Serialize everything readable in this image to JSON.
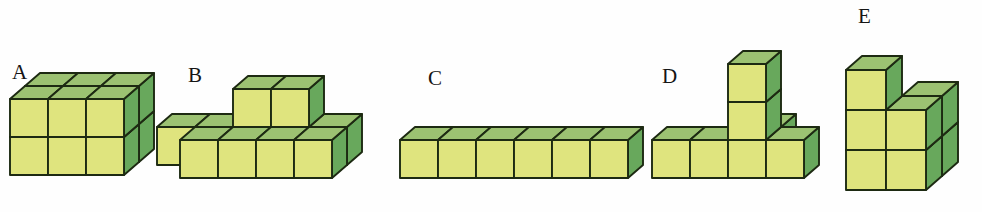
{
  "page": {
    "background_color": "#fefefe",
    "width": 982,
    "height": 212
  },
  "palette": {
    "front_face": "#dfe47e",
    "top_face": "#9cc272",
    "side_face": "#68a85c",
    "edge_stroke": "#1d2a12",
    "label_color": "#151515"
  },
  "figures": [
    {
      "id": "A",
      "label": "A",
      "label_x": 12,
      "label_y": 62,
      "origin_x": 10,
      "origin_y": 175,
      "cube": 38,
      "dx": 15,
      "dy": -13,
      "description": "solid 3 wide by 2 tall by 2 deep block",
      "cube_count": 12,
      "cells": [
        {
          "x": 0,
          "y": 0,
          "z": 0
        },
        {
          "x": 1,
          "y": 0,
          "z": 0
        },
        {
          "x": 2,
          "y": 0,
          "z": 0
        },
        {
          "x": 0,
          "y": 1,
          "z": 0
        },
        {
          "x": 1,
          "y": 1,
          "z": 0
        },
        {
          "x": 2,
          "y": 1,
          "z": 0
        },
        {
          "x": 0,
          "y": 0,
          "z": 1
        },
        {
          "x": 1,
          "y": 0,
          "z": 1
        },
        {
          "x": 2,
          "y": 0,
          "z": 1
        },
        {
          "x": 0,
          "y": 1,
          "z": 1
        },
        {
          "x": 1,
          "y": 1,
          "z": 1
        },
        {
          "x": 2,
          "y": 1,
          "z": 1
        }
      ]
    },
    {
      "id": "B",
      "label": "B",
      "label_x": 188,
      "label_y": 65,
      "origin_x": 180,
      "origin_y": 178,
      "cube": 38,
      "dx": 15,
      "dy": -13,
      "description": "row of four cubes one deep with two cubes on a second level and a back row offset",
      "cube_count": 11,
      "cells": [
        {
          "x": 0,
          "y": 0,
          "z": 0
        },
        {
          "x": 1,
          "y": 0,
          "z": 0
        },
        {
          "x": 2,
          "y": 0,
          "z": 0
        },
        {
          "x": 3,
          "y": 0,
          "z": 0
        },
        {
          "x": -1,
          "y": 0,
          "z": 1
        },
        {
          "x": 0,
          "y": 0,
          "z": 1
        },
        {
          "x": 1,
          "y": 0,
          "z": 1
        },
        {
          "x": 2,
          "y": 0,
          "z": 1
        },
        {
          "x": 3,
          "y": 0,
          "z": 1
        },
        {
          "x": 1,
          "y": 1,
          "z": 1
        },
        {
          "x": 2,
          "y": 1,
          "z": 1
        }
      ]
    },
    {
      "id": "C",
      "label": "C",
      "label_x": 428,
      "label_y": 68,
      "origin_x": 400,
      "origin_y": 178,
      "cube": 38,
      "dx": 15,
      "dy": -13,
      "description": "single flat row of six cubes one high one deep",
      "cube_count": 6,
      "cells": [
        {
          "x": 0,
          "y": 0,
          "z": 0
        },
        {
          "x": 1,
          "y": 0,
          "z": 0
        },
        {
          "x": 2,
          "y": 0,
          "z": 0
        },
        {
          "x": 3,
          "y": 0,
          "z": 0
        },
        {
          "x": 4,
          "y": 0,
          "z": 0
        },
        {
          "x": 5,
          "y": 0,
          "z": 0
        }
      ]
    },
    {
      "id": "D",
      "label": "D",
      "label_x": 662,
      "label_y": 66,
      "origin_x": 652,
      "origin_y": 178,
      "cube": 38,
      "dx": 15,
      "dy": -13,
      "description": "base row of four cubes with a two cube tall tower rising from the third position",
      "cube_count": 7,
      "cells": [
        {
          "x": 0,
          "y": 0,
          "z": 0
        },
        {
          "x": 1,
          "y": 0,
          "z": 0
        },
        {
          "x": 2,
          "y": 0,
          "z": 0
        },
        {
          "x": 3,
          "y": 0,
          "z": 0
        },
        {
          "x": 2,
          "y": 1,
          "z": 0
        },
        {
          "x": 2,
          "y": 2,
          "z": 0
        },
        {
          "x": 2,
          "y": 0,
          "z": 1
        }
      ]
    },
    {
      "id": "E",
      "label": "E",
      "label_x": 858,
      "label_y": 6,
      "origin_x": 846,
      "origin_y": 190,
      "cube": 40,
      "dx": 16,
      "dy": -14,
      "description": "stepped pyramid two cubes wide at the base two on the middle level and one on top",
      "cube_count": 7,
      "cells": [
        {
          "x": 0,
          "y": 0,
          "z": 0
        },
        {
          "x": 1,
          "y": 0,
          "z": 0
        },
        {
          "x": 1,
          "y": 0,
          "z": 1
        },
        {
          "x": 0,
          "y": 1,
          "z": 0
        },
        {
          "x": 1,
          "y": 1,
          "z": 0
        },
        {
          "x": 1,
          "y": 1,
          "z": 1
        },
        {
          "x": 0,
          "y": 2,
          "z": 0
        }
      ]
    }
  ]
}
